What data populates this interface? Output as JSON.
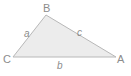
{
  "diagram": {
    "type": "triangle",
    "background_color": "#ffffff",
    "shape": {
      "name": "triangle",
      "fill_color": "#ececec",
      "stroke_color": "#b8b8b8",
      "stroke_width": 1,
      "vertices": [
        {
          "id": "B",
          "x": 46,
          "y": 15
        },
        {
          "id": "A",
          "x": 116,
          "y": 57
        },
        {
          "id": "C",
          "x": 13,
          "y": 57
        }
      ],
      "points_attr": "46,15 116,57 13,57"
    },
    "vertex_labels": [
      {
        "id": "vertex-B",
        "text": "B",
        "x": 43,
        "y": 3
      },
      {
        "id": "vertex-C",
        "text": "C",
        "x": 3,
        "y": 54
      },
      {
        "id": "vertex-A",
        "text": "A",
        "x": 117,
        "y": 54
      }
    ],
    "side_labels": [
      {
        "id": "side-a",
        "text": "a",
        "between": "C-B",
        "x": 24,
        "y": 29
      },
      {
        "id": "side-b",
        "text": "b",
        "between": "C-A",
        "x": 57,
        "y": 61
      },
      {
        "id": "side-c",
        "text": "c",
        "between": "B-A",
        "x": 77,
        "y": 28
      }
    ],
    "text_color": "#8c8c8c"
  }
}
